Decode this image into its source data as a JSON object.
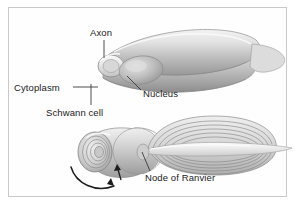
{
  "figure": {
    "background_color": "#ffffff",
    "frame_color": "#c9c9c9",
    "style": "grayscale biological illustration"
  },
  "labels": {
    "axon": "Axon",
    "cytoplasm": "Cytoplasm",
    "schwann_cell": "Schwann cell",
    "nucleus": "Nucleus",
    "node_of_ranvier": "Node of Ranvier"
  },
  "icons": {
    "rotation_arrow": "curved-arrow-icon"
  },
  "colors": {
    "text": "#1b1b1b",
    "leader_line": "#4a4a4a",
    "membrane_light": "#ededed",
    "membrane_mid": "#c6c6c6",
    "membrane_dark": "#9a9a9a",
    "outline": "#8c8c8c"
  }
}
